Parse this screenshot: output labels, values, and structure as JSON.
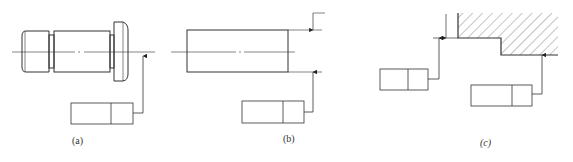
{
  "figure": {
    "panels": [
      {
        "id": "a",
        "label": "(a)",
        "description": "Stepped shaft with feature control frame leader to axis"
      },
      {
        "id": "b",
        "label": "(b)",
        "description": "Cylinder with feature control frame leader aligned with diameter dimension"
      },
      {
        "id": "c",
        "label": "(c)",
        "description": "Stepped hatched part with feature control frames pointing to surfaces"
      }
    ],
    "frame_cells": 2,
    "colors": {
      "line": "#333333",
      "thin": "#555555",
      "background": "#ffffff"
    }
  }
}
